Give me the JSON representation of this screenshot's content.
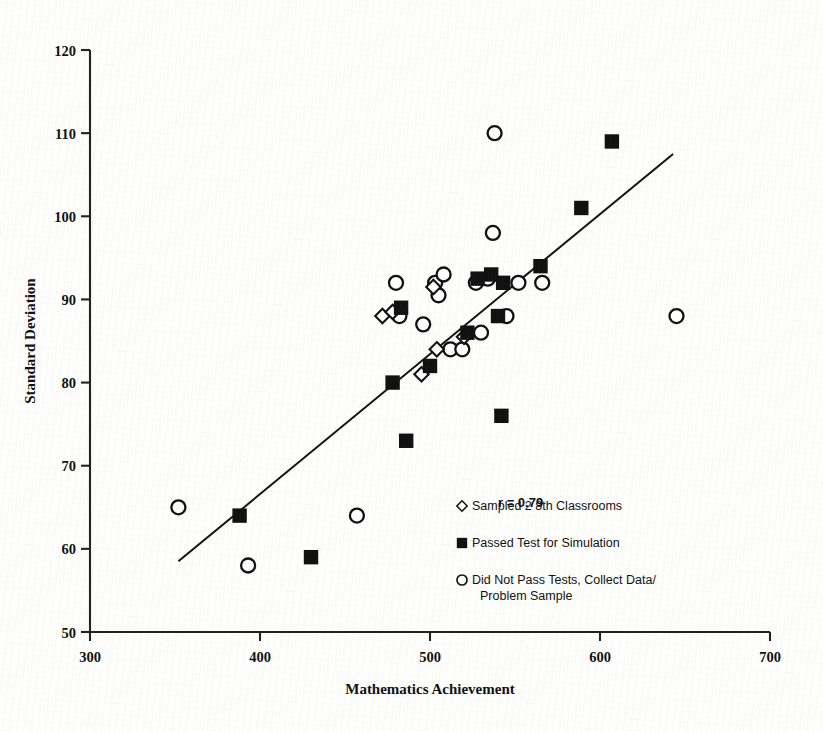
{
  "chart_data": {
    "type": "scatter",
    "title": "",
    "xlabel": "Mathematics Achievement",
    "ylabel": "Standard Deviation",
    "xlim": [
      300,
      700
    ],
    "ylim": [
      50,
      120
    ],
    "xticks": [
      300,
      400,
      500,
      600,
      700
    ],
    "yticks": [
      50,
      60,
      70,
      80,
      90,
      100,
      110,
      120
    ],
    "grid": false,
    "legend_position": "inside-lower-right",
    "annotations": [
      {
        "text": "r = 0.79",
        "x": 540,
        "y": 65
      }
    ],
    "correlation_r": 0.79,
    "trendline": {
      "label": "linear fit",
      "x_start": 352,
      "y_start": 58.5,
      "x_end": 643,
      "y_end": 107.5
    },
    "series": [
      {
        "name": "Sampled 2 8th Classrooms",
        "marker": "open-diamond",
        "points": [
          {
            "x": 472,
            "y": 88
          },
          {
            "x": 478,
            "y": 88.5
          },
          {
            "x": 502,
            "y": 91.5
          },
          {
            "x": 520,
            "y": 85.5
          },
          {
            "x": 504,
            "y": 84
          },
          {
            "x": 495,
            "y": 81
          }
        ]
      },
      {
        "name": "Passed Test for Simulation",
        "marker": "filled-square",
        "points": [
          {
            "x": 388,
            "y": 64
          },
          {
            "x": 430,
            "y": 59
          },
          {
            "x": 478,
            "y": 80
          },
          {
            "x": 486,
            "y": 73
          },
          {
            "x": 483,
            "y": 89
          },
          {
            "x": 500,
            "y": 82
          },
          {
            "x": 522,
            "y": 86
          },
          {
            "x": 528,
            "y": 92.5
          },
          {
            "x": 536,
            "y": 93
          },
          {
            "x": 540,
            "y": 88
          },
          {
            "x": 543,
            "y": 92
          },
          {
            "x": 542,
            "y": 76
          },
          {
            "x": 565,
            "y": 94
          },
          {
            "x": 589,
            "y": 101
          },
          {
            "x": 607,
            "y": 109
          }
        ]
      },
      {
        "name": "Did Not Pass Tests, Collect Data/ Problem Sample",
        "marker": "open-circle",
        "points": [
          {
            "x": 352,
            "y": 65
          },
          {
            "x": 393,
            "y": 58
          },
          {
            "x": 457,
            "y": 64
          },
          {
            "x": 482,
            "y": 88
          },
          {
            "x": 480,
            "y": 92
          },
          {
            "x": 496,
            "y": 87
          },
          {
            "x": 503,
            "y": 92
          },
          {
            "x": 508,
            "y": 93
          },
          {
            "x": 505,
            "y": 90.5
          },
          {
            "x": 512,
            "y": 84
          },
          {
            "x": 519,
            "y": 84
          },
          {
            "x": 527,
            "y": 92
          },
          {
            "x": 530,
            "y": 86
          },
          {
            "x": 534,
            "y": 92.5
          },
          {
            "x": 537,
            "y": 98
          },
          {
            "x": 538,
            "y": 110
          },
          {
            "x": 545,
            "y": 88
          },
          {
            "x": 552,
            "y": 92
          },
          {
            "x": 566,
            "y": 92
          },
          {
            "x": 645,
            "y": 88
          }
        ]
      }
    ]
  },
  "legend": {
    "items": [
      {
        "marker": "open-diamond",
        "label": "Sampled 2 8th Classrooms"
      },
      {
        "marker": "filled-square",
        "label": "Passed Test for Simulation"
      },
      {
        "marker": "open-circle",
        "label": "Did Not Pass Tests, Collect Data/",
        "label2": "Problem Sample"
      }
    ]
  },
  "colors": {
    "ink": "#111111",
    "axis": "#222222",
    "page": "#fdfdfc"
  }
}
